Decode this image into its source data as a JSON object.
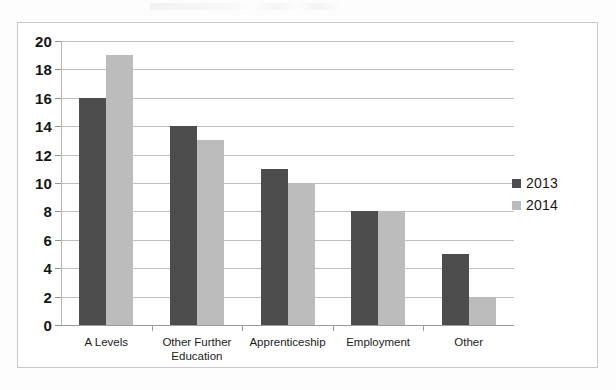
{
  "chart_data": {
    "type": "bar",
    "title": "",
    "subtitle": "",
    "xlabel": "",
    "ylabel": "",
    "grid": true,
    "legend_position": "right",
    "ylim": [
      0,
      20
    ],
    "ytick_step": 2,
    "yticks": [
      "20",
      "18",
      "16",
      "14",
      "12",
      "10",
      "8",
      "6",
      "4",
      "2",
      "0"
    ],
    "categories": [
      "A Levels",
      "Other Further\nEducation",
      "Apprenticeship",
      "Employment",
      "Other"
    ],
    "series": [
      {
        "name": "2013",
        "color": "#4d4d4d",
        "values": [
          16,
          14,
          11,
          8,
          5
        ]
      },
      {
        "name": "2014",
        "color": "#bcbcbc",
        "values": [
          19,
          13,
          10,
          8,
          2
        ]
      }
    ]
  },
  "legend": {
    "items": [
      {
        "label": "2013",
        "color": "#4d4d4d"
      },
      {
        "label": "2014",
        "color": "#bcbcbc"
      }
    ]
  },
  "colors": {
    "series_2013": "#4d4d4d",
    "series_2014": "#bcbcbc",
    "gridline": "#bfbfbf",
    "frame": "#c9c9c9",
    "text": "#161616",
    "background": "#ffffff"
  }
}
